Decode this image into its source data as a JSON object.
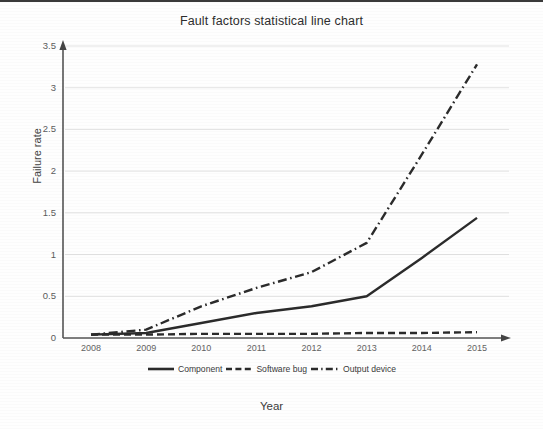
{
  "chart_data": {
    "type": "line",
    "title": "Fault factors statistical line chart",
    "xlabel": "Year",
    "ylabel": "Failure rate",
    "categories": [
      "2008",
      "2009",
      "2010",
      "2011",
      "2012",
      "2013",
      "2014",
      "2015"
    ],
    "x": [
      2008,
      2009,
      2010,
      2011,
      2012,
      2013,
      2014,
      2015
    ],
    "ylim": [
      0,
      3.5
    ],
    "yticks": [
      "0",
      "0.5",
      "1",
      "1.5",
      "2",
      "2.5",
      "3",
      "3.5"
    ],
    "ytick_values": [
      0,
      0.5,
      1,
      1.5,
      2,
      2.5,
      3,
      3.5
    ],
    "grid": true,
    "grid_axis": "y",
    "legend_position": "bottom",
    "series": [
      {
        "name": "Component",
        "style": "solid",
        "color": "#2b2b2b",
        "values": [
          0.04,
          0.06,
          0.18,
          0.3,
          0.38,
          0.5,
          0.96,
          1.44
        ]
      },
      {
        "name": "Software bug",
        "style": "dashed",
        "color": "#2b2b2b",
        "values": [
          0.04,
          0.04,
          0.05,
          0.05,
          0.05,
          0.06,
          0.06,
          0.07
        ]
      },
      {
        "name": "Output device",
        "style": "dash-dot",
        "color": "#2b2b2b",
        "values": [
          0.04,
          0.1,
          0.38,
          0.6,
          0.79,
          1.14,
          2.2,
          3.28
        ]
      }
    ]
  },
  "legend": {
    "items": [
      {
        "label": "Component",
        "icon": "solid-line-swatch"
      },
      {
        "label": "Software bug",
        "icon": "dashed-line-swatch"
      },
      {
        "label": "Output device",
        "icon": "dash-dot-line-swatch"
      }
    ]
  },
  "colors": {
    "ink": "#2b2b2b",
    "axis": "#555555",
    "grid": "#e2e2e2",
    "background": "#fefefe"
  }
}
